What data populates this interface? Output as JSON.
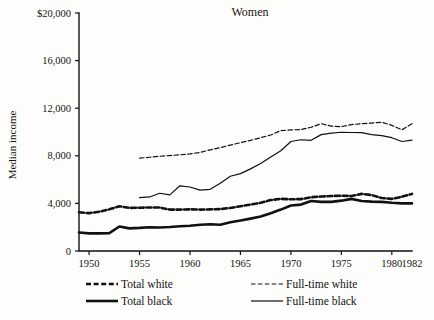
{
  "chart_data": {
    "type": "line",
    "title": "Women",
    "xlabel": "",
    "ylabel": "Median income",
    "xlim": [
      1949,
      1982
    ],
    "ylim": [
      0,
      20000
    ],
    "grid": false,
    "legend_position": "bottom",
    "ytick_labels": [
      "$20,000",
      "16,000",
      "12,000",
      "8,000",
      "4,000",
      "0"
    ],
    "ytick_values": [
      20000,
      16000,
      12000,
      8000,
      4000,
      0
    ],
    "xtick_labels": [
      "1950",
      "1955",
      "1960",
      "1965",
      "1970",
      "1975",
      "1980",
      "1982"
    ],
    "xtick_values": [
      1950,
      1955,
      1960,
      1965,
      1970,
      1975,
      1980,
      1982
    ],
    "series": [
      {
        "name": "Total white",
        "style": "thick-dashed",
        "x": [
          1949,
          1950,
          1951,
          1952,
          1953,
          1954,
          1955,
          1956,
          1957,
          1958,
          1959,
          1960,
          1961,
          1962,
          1963,
          1964,
          1965,
          1966,
          1967,
          1968,
          1969,
          1970,
          1971,
          1972,
          1973,
          1974,
          1975,
          1976,
          1977,
          1978,
          1979,
          1980,
          1981,
          1982
        ],
        "values": [
          3250,
          3180,
          3300,
          3500,
          3760,
          3620,
          3640,
          3660,
          3650,
          3480,
          3480,
          3500,
          3480,
          3500,
          3520,
          3620,
          3760,
          3900,
          4050,
          4280,
          4380,
          4350,
          4360,
          4520,
          4580,
          4620,
          4650,
          4620,
          4800,
          4700,
          4450,
          4380,
          4560,
          4800
        ]
      },
      {
        "name": "Total black",
        "style": "thick-solid",
        "x": [
          1949,
          1950,
          1951,
          1952,
          1953,
          1954,
          1955,
          1956,
          1957,
          1958,
          1959,
          1960,
          1961,
          1962,
          1963,
          1964,
          1965,
          1966,
          1967,
          1968,
          1969,
          1970,
          1971,
          1972,
          1973,
          1974,
          1975,
          1976,
          1977,
          1978,
          1979,
          1980,
          1981,
          1982
        ],
        "values": [
          1560,
          1480,
          1480,
          1500,
          2060,
          1900,
          1940,
          2000,
          1980,
          2020,
          2080,
          2120,
          2200,
          2250,
          2200,
          2420,
          2560,
          2720,
          2900,
          3180,
          3480,
          3820,
          3900,
          4200,
          4130,
          4130,
          4230,
          4380,
          4200,
          4150,
          4130,
          4050,
          4000,
          4000
        ]
      },
      {
        "name": "Full-time white",
        "style": "thin-dashed",
        "x": [
          1955,
          1956,
          1957,
          1958,
          1959,
          1960,
          1961,
          1962,
          1963,
          1964,
          1965,
          1966,
          1967,
          1968,
          1969,
          1970,
          1971,
          1972,
          1973,
          1974,
          1975,
          1976,
          1977,
          1978,
          1979,
          1980,
          1981,
          1982
        ],
        "values": [
          7800,
          7880,
          7960,
          8020,
          8080,
          8160,
          8280,
          8500,
          8680,
          8900,
          9100,
          9300,
          9520,
          9750,
          10120,
          10180,
          10200,
          10400,
          10700,
          10500,
          10450,
          10620,
          10700,
          10750,
          10820,
          10560,
          10180,
          10700
        ]
      },
      {
        "name": "Full-time black",
        "style": "thin-solid",
        "x": [
          1955,
          1956,
          1957,
          1958,
          1959,
          1960,
          1961,
          1962,
          1963,
          1964,
          1965,
          1966,
          1967,
          1968,
          1969,
          1970,
          1971,
          1972,
          1973,
          1974,
          1975,
          1976,
          1977,
          1978,
          1979,
          1980,
          1981,
          1982
        ],
        "values": [
          4480,
          4540,
          4850,
          4720,
          5480,
          5380,
          5120,
          5180,
          5700,
          6280,
          6500,
          6900,
          7350,
          7900,
          8420,
          9200,
          9350,
          9300,
          9780,
          9900,
          9980,
          9960,
          9950,
          9780,
          9700,
          9520,
          9200,
          9320
        ]
      }
    ]
  },
  "legend": {
    "entries": [
      {
        "label": "Total white",
        "style": "thick-dashed"
      },
      {
        "label": "Full-time white",
        "style": "thin-dashed"
      },
      {
        "label": "Total black",
        "style": "thick-solid"
      },
      {
        "label": "Full-time black",
        "style": "thin-solid"
      }
    ]
  }
}
